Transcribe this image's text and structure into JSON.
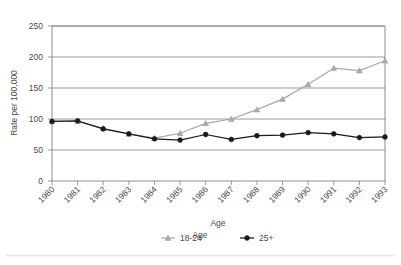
{
  "chart_data": {
    "type": "line",
    "title": "",
    "xlabel": "Age",
    "ylabel": "Rate per 100,000",
    "x": [
      "1980",
      "1981",
      "1982",
      "1983",
      "1984",
      "1985",
      "1986",
      "1987",
      "1988",
      "1989",
      "1990",
      "1991",
      "1992",
      "1993"
    ],
    "xlim": [
      1980,
      1993
    ],
    "ylim": [
      0,
      250
    ],
    "yticks": [
      0,
      50,
      100,
      150,
      200,
      250
    ],
    "ytick_labels": [
      "0",
      "50",
      "100",
      "150",
      "200",
      "250"
    ],
    "grid": "horizontal",
    "legend_position": "bottom",
    "legend_title": "Age",
    "series": [
      {
        "name": "18-24",
        "color": "#a8a8a8",
        "marker": "triangle",
        "values": [
          96,
          96,
          85,
          76,
          69,
          77,
          93,
          100,
          115,
          132,
          156,
          182,
          178,
          194
        ]
      },
      {
        "name": "25+",
        "color": "#1a1a1a",
        "marker": "circle",
        "values": [
          96,
          97,
          84,
          76,
          68,
          66,
          75,
          67,
          73,
          74,
          78,
          76,
          70,
          71
        ]
      }
    ]
  },
  "axes": {
    "y_axis_title": "Rate per 100,000",
    "x_axis_title": "Age"
  },
  "legend": {
    "title": "Age",
    "entries": [
      {
        "label": "18-24",
        "color": "#a8a8a8"
      },
      {
        "label": "25+",
        "color": "#1a1a1a"
      }
    ]
  },
  "colors": {
    "series_1824": "#a8a8a8",
    "series_25plus": "#1a1a1a",
    "gridline": "#808080",
    "axis": "#808080",
    "text": "#4a4a4a",
    "background": "#ffffff",
    "footer_rule": "#e8e8e8"
  }
}
